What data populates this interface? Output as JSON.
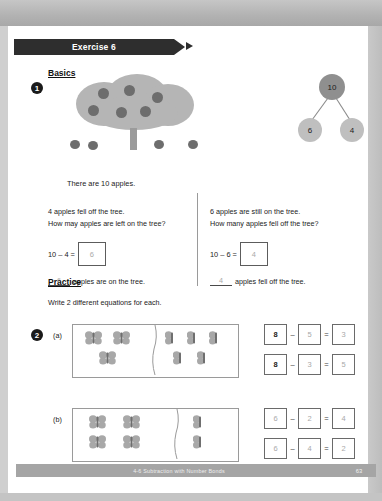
{
  "banner": {
    "label": "Exercise 6"
  },
  "sections": {
    "basics_heading": "Basics",
    "practice_heading": "Practice",
    "practice_instruction": "Write 2 different equations for each."
  },
  "question1": {
    "number": "1",
    "intro": "There are 10 apples.",
    "left": {
      "prompt_line1": "4 apples fell off the tree.",
      "prompt_line2": "How may apples are left on the tree?",
      "equation_text": "10 – 4 =",
      "equation_answer": "6",
      "blank_answer": "6",
      "blank_sentence": "apples are on the tree."
    },
    "right": {
      "prompt_line1": "6 apples are still on the tree.",
      "prompt_line2": "How many apples fell off the tree?",
      "equation_text": "10 – 6 =",
      "equation_answer": "4",
      "blank_answer": "4",
      "blank_sentence": "apples fell off the tree."
    },
    "number_bond": {
      "whole": "10",
      "part_left": "6",
      "part_right": "4"
    },
    "tree": {
      "apples_in_canopy": 6,
      "apples_on_ground": 4
    }
  },
  "question2": {
    "number": "2",
    "parts": [
      {
        "label": "(a)",
        "butterflies_left": 3,
        "butterflies_right": 5,
        "equations": [
          {
            "minuend": "8",
            "minus": "–",
            "subtrahend": "5",
            "equals": "=",
            "difference": "3"
          },
          {
            "minuend": "8",
            "minus": "–",
            "subtrahend": "3",
            "equals": "=",
            "difference": "5"
          }
        ]
      },
      {
        "label": "(b)",
        "butterflies_left": 4,
        "butterflies_right": 2,
        "equations": [
          {
            "minuend": "6",
            "minus": "–",
            "subtrahend": "2",
            "equals": "=",
            "difference": "4"
          },
          {
            "minuend": "6",
            "minus": "–",
            "subtrahend": "4",
            "equals": "=",
            "difference": "2"
          }
        ]
      }
    ]
  },
  "footer": {
    "title": "4-6 Subtraction with Number Bonds",
    "page": "63"
  },
  "colors": {
    "banner": "#2e2e2e",
    "canopy": "#b5b5b5",
    "apple": "#6d6d6d",
    "bond_whole": "#8f8f8f",
    "bond_part": "#bfbfbf",
    "butterfly": "#a8a8a8",
    "handwriting": "#a9a9a9",
    "footer_bar": "#a5a5a5"
  }
}
